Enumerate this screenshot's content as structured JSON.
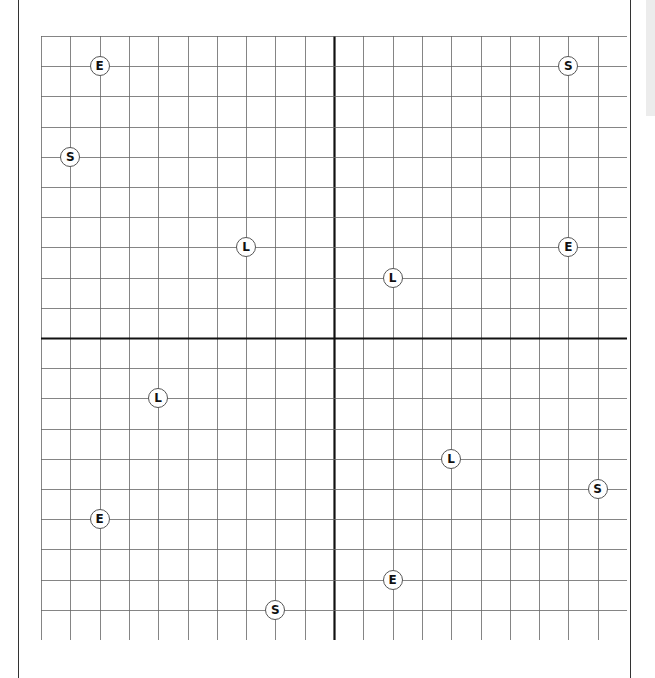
{
  "grid": {
    "columns": 20,
    "rows": 20,
    "cell_width": 29.3,
    "cell_height": 30.2,
    "axis_column": 10,
    "axis_row": 10,
    "line_color": "#666666",
    "axis_color": "#111111"
  },
  "markers": [
    {
      "label": "E",
      "col": 2,
      "row": 1
    },
    {
      "label": "S",
      "col": 1,
      "row": 4
    },
    {
      "label": "L",
      "col": 7,
      "row": 7
    },
    {
      "label": "S",
      "col": 18,
      "row": 1
    },
    {
      "label": "E",
      "col": 18,
      "row": 7
    },
    {
      "label": "L",
      "col": 12,
      "row": 8
    },
    {
      "label": "L",
      "col": 4,
      "row": 12
    },
    {
      "label": "L",
      "col": 14,
      "row": 14
    },
    {
      "label": "S",
      "col": 19,
      "row": 15
    },
    {
      "label": "E",
      "col": 2,
      "row": 16
    },
    {
      "label": "E",
      "col": 12,
      "row": 18
    },
    {
      "label": "S",
      "col": 8,
      "row": 19
    }
  ]
}
